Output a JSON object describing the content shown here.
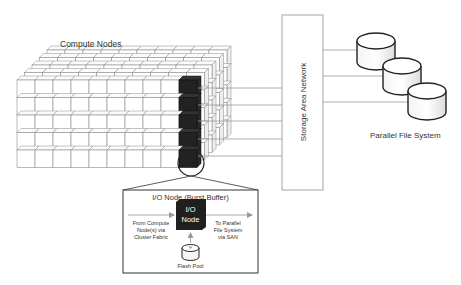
{
  "diagram": {
    "compute_nodes_label": "Compute Nodes",
    "san_label": "Storage Area Network",
    "pfs_label": "Parallel File System",
    "io_box": {
      "title": "I/O Node (Burst Buffer)",
      "node_label_line1": "I/O",
      "node_label_line2": "Node",
      "from_line1": "From Compute",
      "from_line2": "Node(s) via",
      "from_line3": "Cluster Fabric",
      "to_line1": "To Parallel",
      "to_line2": "File System",
      "to_line3": "via SAN",
      "flash_label": "Flash Pool"
    },
    "grid": {
      "columns": 10,
      "rows": 5,
      "depth": 5
    },
    "colors": {
      "io_node": "#222222",
      "line": "#888888",
      "outline": "#999999",
      "text": "#333333"
    }
  }
}
